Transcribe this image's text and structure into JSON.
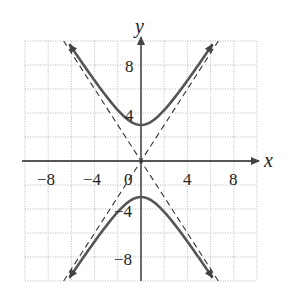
{
  "chart_data": {
    "type": "line",
    "title": "",
    "equation_implied": "y^2/9 - x^2/4 = 1",
    "xlabel": "x",
    "ylabel": "y",
    "xlim": [
      -10,
      10
    ],
    "ylim": [
      -10,
      10
    ],
    "grid": true,
    "grid_step": 2,
    "x_ticks": [
      -8,
      -4,
      0,
      4,
      8
    ],
    "y_ticks": [
      8,
      4,
      -4,
      -8
    ],
    "tick_labels": {
      "x": [
        "−8",
        "−4",
        "0",
        "4",
        "8"
      ],
      "y": [
        "8",
        "4",
        "−4",
        "−8"
      ]
    },
    "series": [
      {
        "name": "hyperbola upper branch",
        "style": "solid",
        "vertex": [
          0,
          3
        ]
      },
      {
        "name": "hyperbola lower branch",
        "style": "solid",
        "vertex": [
          0,
          -3
        ]
      },
      {
        "name": "asymptote y = 1.5x",
        "style": "dashed",
        "slope": 1.5
      },
      {
        "name": "asymptote y = -1.5x",
        "style": "dashed",
        "slope": -1.5
      }
    ]
  },
  "labels": {
    "x": "x",
    "y": "y",
    "t_m8": "−8",
    "t_m4": "−4",
    "t_0": "0",
    "t_4": "4",
    "t_8": "8",
    "y8": "8",
    "y4": "4",
    "ym4": "−4",
    "ym8": "−8"
  }
}
